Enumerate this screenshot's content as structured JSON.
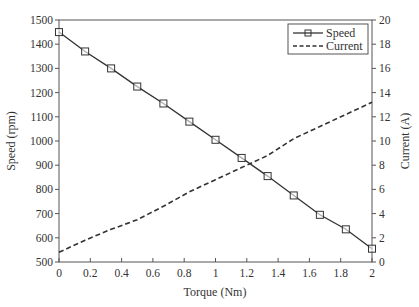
{
  "chart_data": {
    "type": "line",
    "title": "",
    "xlabel": "Torque (Nm)",
    "ylabel": "Speed (rpm)",
    "y2label": "Current (A)",
    "xlim": [
      0,
      2
    ],
    "ylim": [
      500,
      1500
    ],
    "y2lim": [
      0,
      20
    ],
    "grid": false,
    "legend_position": "upper right",
    "x_ticks": [
      "0",
      "0.2",
      "0.4",
      "0.6",
      "0.8",
      "1",
      "1.2",
      "1.4",
      "1.6",
      "1.8",
      "2"
    ],
    "y_ticks": [
      "500",
      "600",
      "700",
      "800",
      "900",
      "1000",
      "1100",
      "1200",
      "1300",
      "1400",
      "1500"
    ],
    "y2_ticks": [
      "0",
      "2",
      "4",
      "6",
      "8",
      "10",
      "12",
      "14",
      "16",
      "18",
      "20"
    ],
    "x": [
      0,
      0.167,
      0.333,
      0.5,
      0.667,
      0.833,
      1.0,
      1.167,
      1.333,
      1.5,
      1.667,
      1.833,
      2.0
    ],
    "series": [
      {
        "name": "Speed",
        "axis": "left",
        "style": "solid-square-markers",
        "values": [
          1450,
          1370,
          1300,
          1225,
          1155,
          1080,
          1005,
          930,
          855,
          775,
          695,
          635,
          555
        ]
      },
      {
        "name": "Current",
        "axis": "right",
        "style": "dashed",
        "values": [
          0.8,
          1.8,
          2.7,
          3.5,
          4.6,
          5.8,
          6.8,
          7.8,
          8.8,
          10.2,
          11.2,
          12.2,
          13.2
        ]
      }
    ]
  },
  "legend": {
    "speed_label": "Speed",
    "current_label": "Current"
  },
  "colors": {
    "line": "#333333",
    "axis": "#555555"
  }
}
